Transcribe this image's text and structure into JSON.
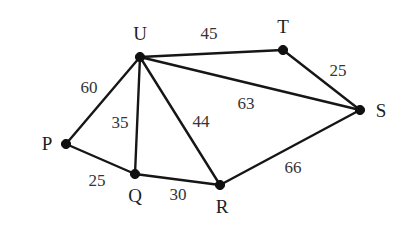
{
  "figure": {
    "background_color": "#ffffff",
    "edge_color": "#161616",
    "vertex_color": "#101010",
    "label_color": "#1d1d1d"
  },
  "chart_data": {
    "type": "diagram",
    "subtype": "weighted-undirected-graph",
    "title": "",
    "xlabel": "",
    "ylabel": "",
    "grid": false,
    "legend": null,
    "canvas": {
      "width": 412,
      "height": 226
    },
    "nodes": [
      {
        "id": "U",
        "label": "U",
        "x": 140,
        "y": 57,
        "label_x": 140,
        "label_y": 33,
        "label_pos": "above"
      },
      {
        "id": "T",
        "label": "T",
        "x": 283,
        "y": 50,
        "label_x": 283,
        "label_y": 26,
        "label_pos": "above"
      },
      {
        "id": "S",
        "label": "S",
        "x": 360,
        "y": 110,
        "label_x": 381,
        "label_y": 110,
        "label_pos": "right"
      },
      {
        "id": "P",
        "label": "P",
        "x": 66,
        "y": 144,
        "label_x": 47,
        "label_y": 143,
        "label_pos": "left"
      },
      {
        "id": "Q",
        "label": "Q",
        "x": 135,
        "y": 174,
        "label_x": 135,
        "label_y": 195,
        "label_pos": "below"
      },
      {
        "id": "R",
        "label": "R",
        "x": 220,
        "y": 185,
        "label_x": 222,
        "label_y": 206,
        "label_pos": "below"
      }
    ],
    "edges": [
      {
        "source": "U",
        "target": "T",
        "weight": 45,
        "label": "45",
        "label_x": 209,
        "label_y": 33
      },
      {
        "source": "T",
        "target": "S",
        "weight": 25,
        "label": "25",
        "label_x": 338,
        "label_y": 70
      },
      {
        "source": "U",
        "target": "S",
        "weight": 63,
        "label": "63",
        "label_x": 246,
        "label_y": 103
      },
      {
        "source": "U",
        "target": "P",
        "weight": 60,
        "label": "60",
        "label_x": 89,
        "label_y": 87
      },
      {
        "source": "U",
        "target": "Q",
        "weight": 35,
        "label": "35",
        "label_x": 120,
        "label_y": 122
      },
      {
        "source": "U",
        "target": "R",
        "weight": 44,
        "label": "44",
        "label_x": 201,
        "label_y": 121
      },
      {
        "source": "P",
        "target": "Q",
        "weight": 25,
        "label": "25",
        "label_x": 97,
        "label_y": 180
      },
      {
        "source": "Q",
        "target": "R",
        "weight": 30,
        "label": "30",
        "label_x": 178,
        "label_y": 194
      },
      {
        "source": "R",
        "target": "S",
        "weight": 66,
        "label": "66",
        "label_x": 293,
        "label_y": 167
      }
    ],
    "vertex_labels": [
      "U",
      "T",
      "S",
      "P",
      "Q",
      "R"
    ],
    "edge_weights": [
      45,
      25,
      63,
      60,
      35,
      44,
      25,
      30,
      66
    ]
  }
}
